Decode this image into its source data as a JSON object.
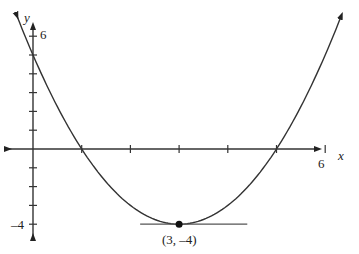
{
  "chart_data": {
    "type": "line",
    "title": "",
    "function": "y = (x - 3)^2 - 4",
    "xlabel": "x",
    "ylabel": "y",
    "xlim": [
      -0.3,
      6.5
    ],
    "ylim": [
      -4.5,
      6.5
    ],
    "x_tick_labels": [
      {
        "value": 6,
        "label": "6"
      }
    ],
    "y_tick_labels": [
      {
        "value": 6,
        "label": "6"
      },
      {
        "value": -4,
        "label": "-4"
      }
    ],
    "x_ticks": [
      1,
      2,
      3,
      4,
      5,
      6
    ],
    "y_ticks": [
      -4,
      -3,
      -2,
      -1,
      1,
      2,
      3,
      4,
      5,
      6
    ],
    "grid": false,
    "series": [
      {
        "name": "parabola",
        "x": [
          -0.4,
          0,
          1,
          2,
          3,
          4,
          5,
          6,
          6.4
        ],
        "y": [
          7.56,
          5,
          0,
          -3,
          -4,
          -3,
          0,
          5,
          7.56
        ]
      }
    ],
    "points": [
      {
        "x": 3,
        "y": -4,
        "label": "(3, –4)"
      }
    ],
    "tangent_line": {
      "y": -4,
      "x_range": [
        2.2,
        4.4
      ]
    }
  },
  "labels": {
    "x_axis": "x",
    "y_axis": "y",
    "x_six": "6",
    "y_six": "6",
    "y_neg_four": "–4",
    "vertex": "(3, –4)"
  }
}
